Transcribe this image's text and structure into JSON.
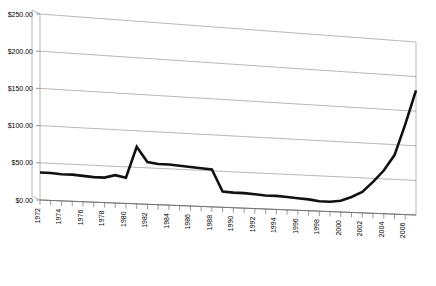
{
  "chart_data": {
    "type": "line",
    "title": "",
    "subtitle": "",
    "xlabel": "",
    "ylabel": "",
    "grid": true,
    "legend": false,
    "style": "3d-perspective-line",
    "ylim": [
      0,
      250
    ],
    "ytick_labels": [
      "$0.00",
      "$50.00",
      "$100.00",
      "$150.00",
      "$200.00",
      "$250.00"
    ],
    "ytick_values": [
      0,
      50,
      100,
      150,
      200,
      250
    ],
    "xlim": [
      1972,
      2007
    ],
    "xtick_labels": [
      "1972",
      "1974",
      "1976",
      "1978",
      "1980",
      "1982",
      "1984",
      "1986",
      "1988",
      "1990",
      "1992",
      "1994",
      "1996",
      "1998",
      "2000",
      "2002",
      "2004",
      "2006"
    ],
    "xtick_step": 2,
    "x": [
      1972,
      1973,
      1974,
      1975,
      1976,
      1977,
      1978,
      1979,
      1980,
      1981,
      1982,
      1983,
      1984,
      1985,
      1986,
      1987,
      1988,
      1989,
      1990,
      1991,
      1992,
      1993,
      1994,
      1995,
      1996,
      1997,
      1998,
      1999,
      2000,
      2001,
      2002,
      2003,
      2004,
      2005,
      2006,
      2007
    ],
    "values": [
      37,
      37,
      36,
      36,
      35,
      34,
      34,
      38,
      35,
      78,
      58,
      56,
      56,
      55,
      54,
      53,
      52,
      22,
      21,
      21,
      20,
      19,
      19,
      18,
      17,
      16,
      14,
      14,
      16,
      22,
      30,
      45,
      62,
      85,
      130,
      180
    ],
    "series": [
      {
        "name": "Price",
        "values": [
          37,
          37,
          36,
          36,
          35,
          34,
          34,
          38,
          35,
          78,
          58,
          56,
          56,
          55,
          54,
          53,
          52,
          22,
          21,
          21,
          20,
          19,
          19,
          18,
          17,
          16,
          14,
          14,
          16,
          22,
          30,
          45,
          62,
          85,
          130,
          180
        ]
      }
    ],
    "annotations": []
  },
  "colors": {
    "line": "#111111",
    "grid": "#9a9a9a",
    "axis": "#6e6e6e",
    "background": "#ffffff"
  }
}
